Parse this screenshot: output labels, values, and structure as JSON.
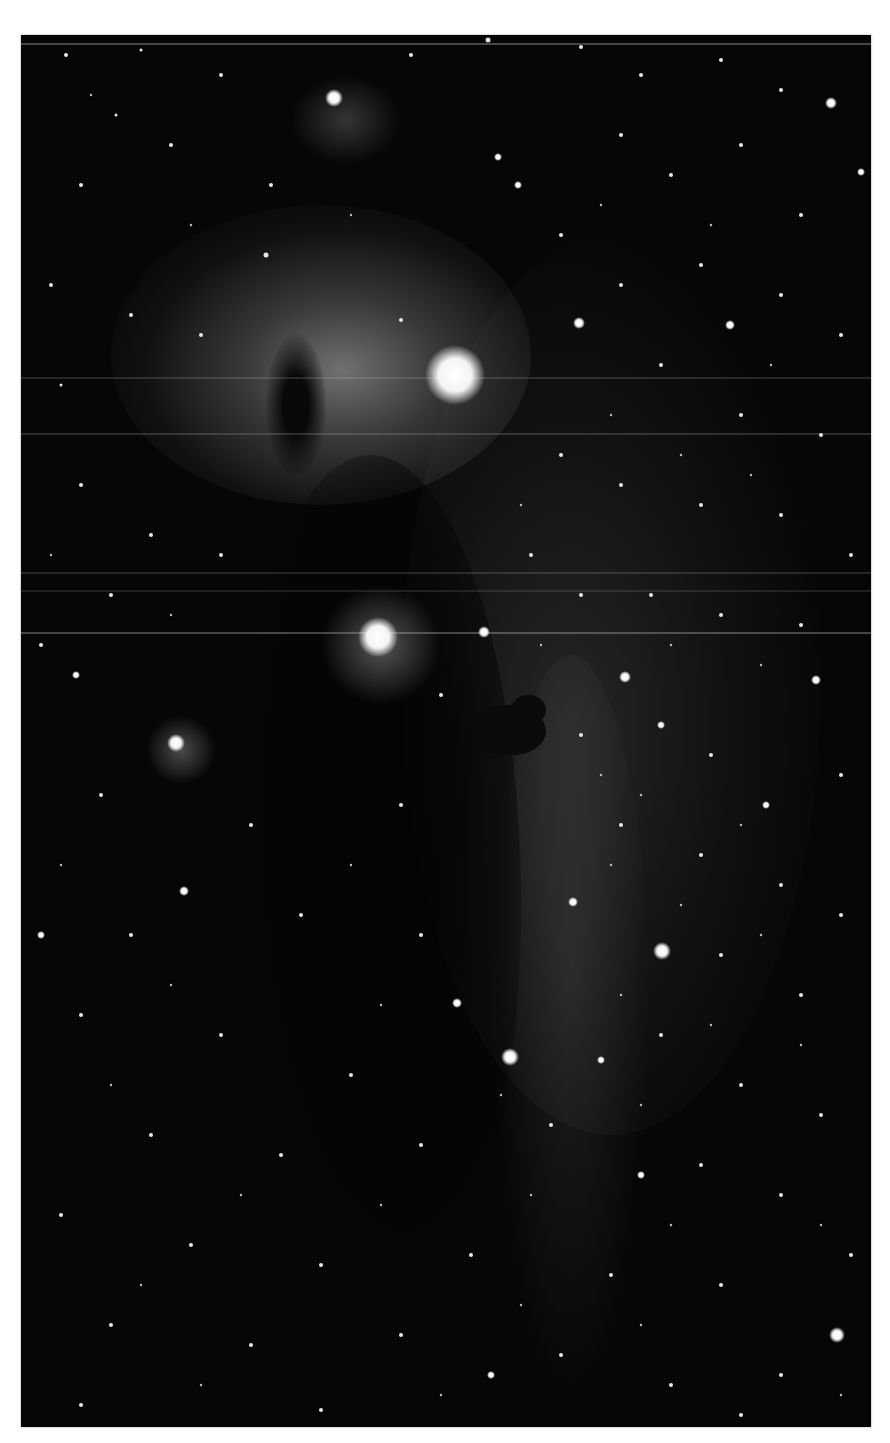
{
  "figure": {
    "background_color": "#060606",
    "page_color": "#ffffff",
    "features": [
      {
        "name": "flame-nebula",
        "x": 300,
        "y": 370
      },
      {
        "name": "bright-star-alnitak",
        "x": 455,
        "y": 375
      },
      {
        "name": "reflection-nebula-ngc2023",
        "x": 378,
        "y": 635
      },
      {
        "name": "horsehead-nebula",
        "x": 520,
        "y": 730
      },
      {
        "name": "small-nebula-top",
        "x": 335,
        "y": 100
      },
      {
        "name": "left-star-glow",
        "x": 175,
        "y": 742
      }
    ]
  },
  "caption": {
    "text": "",
    "note": "Caption text below image is cropped at the bottom edge and illegible"
  }
}
